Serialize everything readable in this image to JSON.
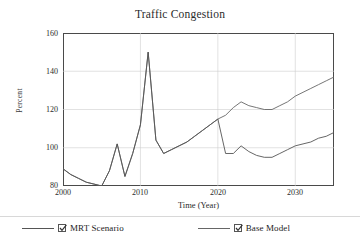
{
  "chart_data": {
    "type": "line",
    "title": "Traffic Congestion",
    "xlabel": "Time (Year)",
    "ylabel": "Percent",
    "xlim": [
      2000,
      2035
    ],
    "ylim": [
      80,
      160
    ],
    "xticks": [
      2000,
      2010,
      2020,
      2030
    ],
    "yticks": [
      80,
      100,
      120,
      140,
      160
    ],
    "grid": true,
    "legend_position": "bottom",
    "x": [
      2000,
      2001,
      2002,
      2003,
      2004,
      2005,
      2006,
      2007,
      2008,
      2009,
      2010,
      2011,
      2012,
      2013,
      2014,
      2015,
      2016,
      2017,
      2018,
      2019,
      2020,
      2021,
      2022,
      2023,
      2024,
      2025,
      2026,
      2027,
      2028,
      2029,
      2030,
      2031,
      2032,
      2033,
      2034,
      2035
    ],
    "series": [
      {
        "name": "Base Model",
        "color": "#666666",
        "values": [
          89,
          86,
          84,
          82,
          81,
          80,
          88,
          102,
          85,
          97,
          112,
          150,
          104,
          97,
          99,
          101,
          103,
          106,
          109,
          112,
          115,
          117,
          121,
          124,
          122,
          121,
          120,
          120,
          122,
          124,
          127,
          129,
          131,
          133,
          135,
          137
        ]
      },
      {
        "name": "MRT Scenario",
        "color": "#555555",
        "values": [
          89,
          86,
          84,
          82,
          81,
          80,
          88,
          102,
          85,
          97,
          112,
          150,
          104,
          97,
          99,
          101,
          103,
          106,
          109,
          112,
          115,
          97,
          97,
          101,
          98,
          96,
          95,
          95,
          97,
          99,
          101,
          102,
          103,
          105,
          106,
          108
        ]
      }
    ]
  },
  "legend": {
    "items": [
      {
        "label": "MRT Scenario",
        "checked": true,
        "checkmark": "✓"
      },
      {
        "label": "Base Model",
        "checked": true,
        "checkmark": "✓"
      }
    ]
  },
  "axis": {
    "y_ticks": [
      "160",
      "140",
      "120",
      "100",
      "80"
    ],
    "x_ticks": [
      "2000",
      "2010",
      "2020",
      "2030"
    ]
  }
}
